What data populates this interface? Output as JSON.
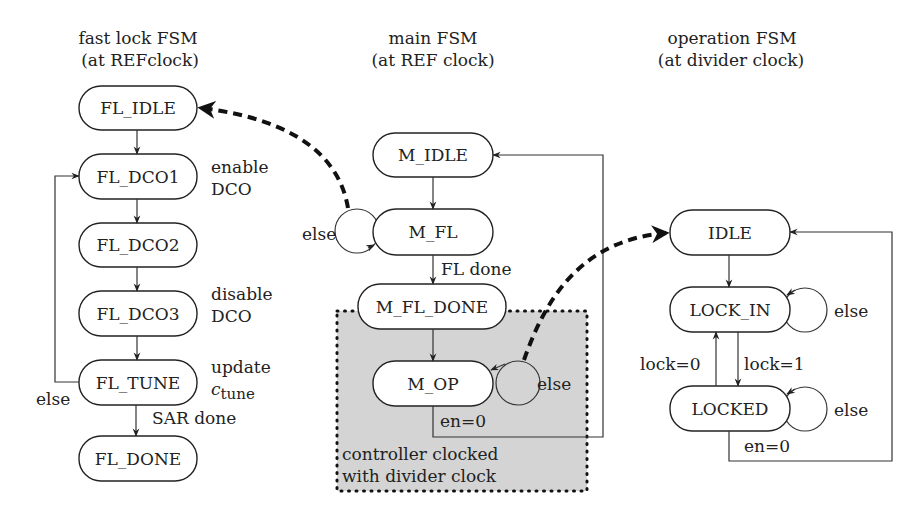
{
  "groups": {
    "fast_lock": {
      "title_line1": "fast lock FSM",
      "title_line2": "(at REFclock)",
      "states": [
        "FL_IDLE",
        "FL_DCO1",
        "FL_DCO2",
        "FL_DCO3",
        "FL_TUNE",
        "FL_DONE"
      ],
      "annotations": {
        "dco1_line1": "enable",
        "dco1_line2": "DCO",
        "dco3_line1": "disable",
        "dco3_line2": "DCO",
        "tune_line1": "update",
        "tune_line2_base": "c",
        "tune_line2_sub": "tune"
      },
      "edge_labels": {
        "tune_else": "else",
        "sar_done": "SAR done"
      }
    },
    "main": {
      "title_line1": "main FSM",
      "title_line2": "(at REF clock)",
      "states": [
        "M_IDLE",
        "M_FL",
        "M_FL_DONE",
        "M_OP"
      ],
      "edge_labels": {
        "fl_else": "else",
        "fl_done": "FL done",
        "op_else": "else",
        "op_en0": "en=0"
      },
      "region_label_line1": "controller clocked",
      "region_label_line2": "with divider clock"
    },
    "operation": {
      "title_line1": "operation FSM",
      "title_line2": "(at divider clock)",
      "states": [
        "IDLE",
        "LOCK_IN",
        "LOCKED"
      ],
      "edge_labels": {
        "lockin_else": "else",
        "lock0": "lock=0",
        "lock1": "lock=1",
        "locked_else": "else",
        "locked_en0": "en=0"
      }
    }
  }
}
